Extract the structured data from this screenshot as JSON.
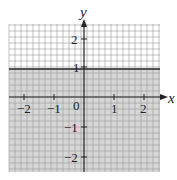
{
  "chart_data": {
    "type": "area",
    "title": "",
    "xlabel": "x",
    "ylabel": "y",
    "xlim": [
      -2.5,
      2.5
    ],
    "ylim": [
      -2.5,
      2.5
    ],
    "grid": true,
    "grid_minor_per_unit": 5,
    "x_ticks": [
      "-2",
      "-1",
      "0",
      "1",
      "2"
    ],
    "y_ticks": [
      "2",
      "1",
      "-1",
      "-2"
    ],
    "boundary": {
      "equation": "y = 1",
      "style": "solid"
    },
    "shaded_region": "y < 1",
    "shade_color": "#d3d3d3",
    "series": [
      {
        "name": "y = 1",
        "x": [
          -2.5,
          2.5
        ],
        "y": [
          1,
          1
        ]
      }
    ]
  },
  "labels": {
    "x_axis": "x",
    "y_axis": "y",
    "origin": "0",
    "xt_m2": "−2",
    "xt_m1": "−1",
    "xt_1": "1",
    "xt_2": "2",
    "yt_2": "2",
    "yt_1": "1",
    "yt_m1": "−1",
    "yt_m2": "−2"
  }
}
